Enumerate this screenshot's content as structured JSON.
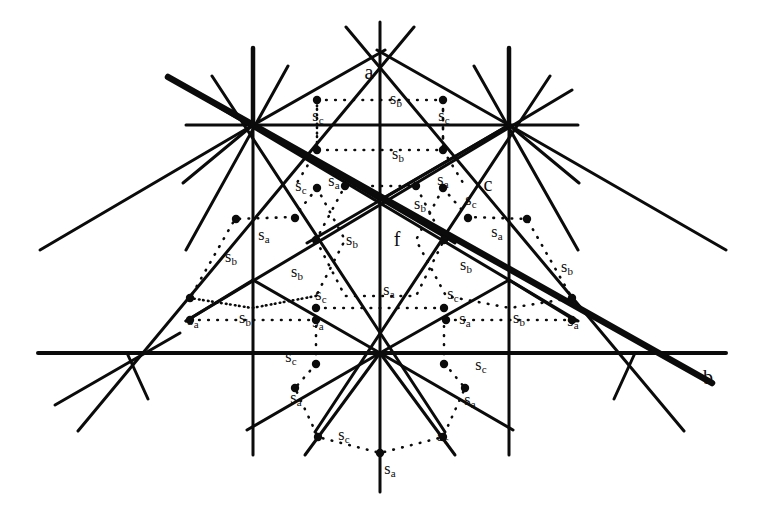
{
  "figure": {
    "kind": "geometric-reflection-diagram",
    "width": 773,
    "height": 512,
    "background_color": "#ffffff",
    "ink_color": "#0b0b0b",
    "thick_line_width": 6.5,
    "thin_line_width": 3.0,
    "dot_radius": 4.2,
    "dotted_dot_radius": 2.0
  },
  "axis_labels": [
    {
      "id": "label-a",
      "text": "a",
      "x": 369,
      "y": 72
    },
    {
      "id": "label-b",
      "text": "b",
      "x": 708,
      "y": 377
    },
    {
      "id": "label-c",
      "text": "c",
      "x": 488,
      "y": 184
    },
    {
      "id": "label-f",
      "text": "f",
      "x": 397,
      "y": 239
    }
  ],
  "generator_labels": [
    {
      "base": "s",
      "sub": "b",
      "x": 396,
      "y": 100
    },
    {
      "base": "s",
      "sub": "c",
      "x": 318,
      "y": 117
    },
    {
      "base": "s",
      "sub": "c",
      "x": 444,
      "y": 117
    },
    {
      "base": "s",
      "sub": "b",
      "x": 398,
      "y": 155
    },
    {
      "base": "s",
      "sub": "c",
      "x": 301,
      "y": 187
    },
    {
      "base": "s",
      "sub": "a",
      "x": 334,
      "y": 182
    },
    {
      "base": "s",
      "sub": "a",
      "x": 443,
      "y": 181
    },
    {
      "base": "s",
      "sub": "b",
      "x": 420,
      "y": 205
    },
    {
      "base": "s",
      "sub": "c",
      "x": 471,
      "y": 201
    },
    {
      "base": "s",
      "sub": "a",
      "x": 497,
      "y": 233
    },
    {
      "base": "s",
      "sub": "a",
      "x": 264,
      "y": 236
    },
    {
      "base": "s",
      "sub": "b",
      "x": 231,
      "y": 258
    },
    {
      "base": "s",
      "sub": "b",
      "x": 352,
      "y": 241
    },
    {
      "base": "s",
      "sub": "b",
      "x": 297,
      "y": 273
    },
    {
      "base": "s",
      "sub": "b",
      "x": 466,
      "y": 266
    },
    {
      "base": "s",
      "sub": "b",
      "x": 567,
      "y": 268
    },
    {
      "base": "s",
      "sub": "c",
      "x": 321,
      "y": 296
    },
    {
      "base": "s",
      "sub": "a",
      "x": 389,
      "y": 291
    },
    {
      "base": "s",
      "sub": "c",
      "x": 453,
      "y": 295
    },
    {
      "base": "s",
      "sub": "a",
      "x": 193,
      "y": 321
    },
    {
      "base": "s",
      "sub": "b",
      "x": 245,
      "y": 319
    },
    {
      "base": "s",
      "sub": "a",
      "x": 318,
      "y": 323
    },
    {
      "base": "s",
      "sub": "a",
      "x": 465,
      "y": 320
    },
    {
      "base": "s",
      "sub": "b",
      "x": 519,
      "y": 319
    },
    {
      "base": "s",
      "sub": "a",
      "x": 573,
      "y": 322
    },
    {
      "base": "s",
      "sub": "c",
      "x": 291,
      "y": 358
    },
    {
      "base": "s",
      "sub": "c",
      "x": 481,
      "y": 366
    },
    {
      "base": "s",
      "sub": "a",
      "x": 296,
      "y": 399
    },
    {
      "base": "s",
      "sub": "a",
      "x": 470,
      "y": 401
    },
    {
      "base": "s",
      "sub": "c",
      "x": 344,
      "y": 436
    },
    {
      "base": "s",
      "sub": "c",
      "x": 443,
      "y": 437
    },
    {
      "base": "s",
      "sub": "a",
      "x": 390,
      "y": 470
    }
  ],
  "vertices": [
    {
      "id": "top-apex",
      "x": 380,
      "y": 48,
      "rays": 6
    },
    {
      "id": "left-upper",
      "x": 253,
      "y": 125,
      "rays": 12
    },
    {
      "id": "right-upper",
      "x": 509,
      "y": 125,
      "rays": 12
    },
    {
      "id": "center-upper",
      "x": 380,
      "y": 200,
      "rays": 6
    },
    {
      "id": "left-mid",
      "x": 253,
      "y": 280,
      "rays": 6
    },
    {
      "id": "right-mid",
      "x": 509,
      "y": 280,
      "rays": 6
    },
    {
      "id": "bottom-left",
      "x": 127,
      "y": 353,
      "rays": 4
    },
    {
      "id": "bottom-center",
      "x": 380,
      "y": 353,
      "rays": 12
    },
    {
      "id": "bottom-right",
      "x": 635,
      "y": 353,
      "rays": 4
    }
  ],
  "thick_lines": [
    {
      "x1": 168,
      "y1": 77,
      "x2": 712,
      "y2": 383
    },
    {
      "x1": 253,
      "y1": 48,
      "x2": 253,
      "y2": 125
    },
    {
      "x1": 509,
      "y1": 48,
      "x2": 509,
      "y2": 125
    }
  ],
  "dotted_cells": [
    {
      "id": "cell-top",
      "shape": "hexagon"
    },
    {
      "id": "cell-upper-left",
      "shape": "hexagon"
    },
    {
      "id": "cell-upper-right",
      "shape": "hexagon"
    },
    {
      "id": "cell-center",
      "shape": "hexagon"
    },
    {
      "id": "cell-left",
      "shape": "hexagon"
    },
    {
      "id": "cell-right",
      "shape": "hexagon"
    },
    {
      "id": "cell-bottom",
      "shape": "hexagon"
    }
  ]
}
